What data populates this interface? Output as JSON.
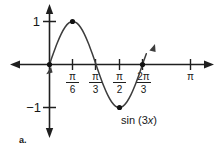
{
  "figure": {
    "item_letter": "a.",
    "curve_label_prefix": "sin (3",
    "curve_label_var": "x",
    "curve_label_suffix": ")",
    "colors": {
      "background": "#ffffff",
      "axis": "#1f1f1f",
      "curve": "#3c3c3c",
      "text": "#171717",
      "point": "#111111"
    }
  },
  "chart_data": {
    "type": "line",
    "title": "",
    "subtitle": "",
    "function": "sin (3x)",
    "xlabel": "",
    "ylabel": "",
    "xlim": [
      -0.12,
      3.45
    ],
    "ylim": [
      -1.45,
      1.45
    ],
    "grid": false,
    "legend": null,
    "amplitude": 1,
    "period": "2π/3",
    "domain_drawn": [
      0,
      2.2
    ],
    "y_axis": {
      "ticks": [
        {
          "value": 1,
          "label": "1"
        },
        {
          "value": -1,
          "label": "−1"
        }
      ],
      "arrows": [
        "up",
        "down"
      ]
    },
    "x_axis": {
      "arrows": [
        "left",
        "right"
      ],
      "ticks": [
        {
          "value": 0.5236,
          "label": "π/6",
          "numerator": "π",
          "denominator": "6"
        },
        {
          "value": 1.0472,
          "label": "π/3",
          "numerator": "π",
          "denominator": "3"
        },
        {
          "value": 1.5708,
          "label": "π/2",
          "numerator": "π",
          "denominator": "2"
        },
        {
          "value": 2.0944,
          "label": "2π/3",
          "numerator": "2π",
          "denominator": "3"
        },
        {
          "value": 3.1416,
          "label": "π",
          "numerator": "π",
          "denominator": ""
        }
      ]
    },
    "marked_points": [
      {
        "x": 0,
        "y": 0,
        "label": "origin"
      },
      {
        "x": 0.5236,
        "y": 1,
        "label": "maximum"
      },
      {
        "x": 1.5708,
        "y": -1,
        "label": "minimum"
      },
      {
        "x": 2.0944,
        "y": 0,
        "label": "zero"
      }
    ],
    "series": [
      {
        "name": "sin (3x)",
        "values": [
          [
            0.0,
            0.0
          ],
          [
            0.0873,
            0.2588
          ],
          [
            0.1745,
            0.5
          ],
          [
            0.2618,
            0.7071
          ],
          [
            0.3491,
            0.866
          ],
          [
            0.4363,
            0.9659
          ],
          [
            0.5236,
            1.0
          ],
          [
            0.6109,
            0.9659
          ],
          [
            0.6981,
            0.866
          ],
          [
            0.7854,
            0.7071
          ],
          [
            0.8727,
            0.5
          ],
          [
            0.9599,
            0.2588
          ],
          [
            1.0472,
            0.0
          ],
          [
            1.1345,
            -0.2588
          ],
          [
            1.2217,
            -0.5
          ],
          [
            1.309,
            -0.7071
          ],
          [
            1.3963,
            -0.866
          ],
          [
            1.4835,
            -0.9659
          ],
          [
            1.5708,
            -1.0
          ],
          [
            1.6581,
            -0.9659
          ],
          [
            1.7453,
            -0.866
          ],
          [
            1.8326,
            -0.7071
          ],
          [
            1.9199,
            -0.5
          ],
          [
            2.0071,
            -0.2588
          ],
          [
            2.0944,
            0.0
          ],
          [
            2.14,
            0.135
          ],
          [
            2.18,
            0.252
          ]
        ]
      }
    ]
  }
}
